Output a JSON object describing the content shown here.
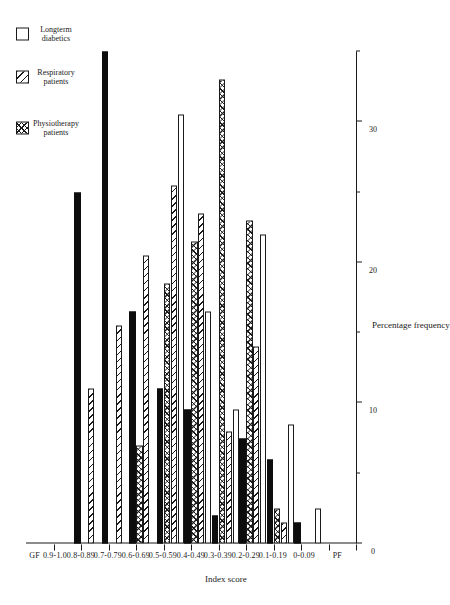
{
  "chart_data": {
    "type": "bar",
    "orientation": "horizontal",
    "title": "",
    "xlabel": "Index score",
    "ylabel": "Percentage frequency",
    "categories": [
      "PF",
      "0-0.09",
      "0.1-0.19",
      "0.2-0.29",
      "0.3-0.39",
      "0.4-0.49",
      "0.5-0.59",
      "0.6-0.69",
      "0.7-0.79",
      "0.8-0.89",
      "0.9-1.0",
      "GF"
    ],
    "ylim": [
      0,
      35
    ],
    "yticks": [
      0,
      10,
      20,
      30
    ],
    "ytick_labels": [
      "0",
      "10",
      "20",
      "30"
    ],
    "grid": false,
    "legend_position": "upper-left",
    "series": [
      {
        "name": "Physiotherapy patients",
        "pattern": "crosshatch",
        "values": [
          0,
          0,
          2.5,
          23.0,
          33.0,
          21.5,
          18.5,
          7.0,
          0,
          0,
          0,
          0
        ]
      },
      {
        "name": "Respiratory patients",
        "pattern": "diagonal-hatch",
        "values": [
          0,
          0,
          1.5,
          14.0,
          8.0,
          23.5,
          25.5,
          20.5,
          15.5,
          11.0,
          0,
          0
        ]
      },
      {
        "name": "Longterm diabetics",
        "pattern": "open",
        "values": [
          0,
          2.5,
          8.5,
          22.0,
          9.5,
          16.5,
          30.5,
          0,
          0,
          0,
          0,
          0
        ]
      },
      {
        "name": "General medical patients",
        "pattern": "solid",
        "values": [
          0,
          0,
          1.5,
          6.0,
          7.5,
          2.0,
          9.5,
          11.0,
          16.5,
          35.0,
          25.0,
          0
        ]
      }
    ]
  },
  "legend": {
    "items": [
      {
        "label": "Physiotherapy\npatients",
        "pattern": "crosshatch"
      },
      {
        "label": "Respiratory\npatients",
        "pattern": "diagonal-hatch"
      },
      {
        "label": "Longterm\ndiabetics",
        "pattern": "open"
      },
      {
        "label": "General  medical\npatients",
        "pattern": "solid"
      }
    ]
  },
  "axes": {
    "value_axis_title": "Percentage frequency",
    "category_axis_title": "Index score"
  }
}
